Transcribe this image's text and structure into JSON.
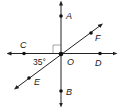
{
  "diagram": {
    "type": "intersecting-lines",
    "center": {
      "label": "O",
      "x": 61,
      "y": 54
    },
    "points": [
      {
        "label": "A",
        "x": 61,
        "y": 16,
        "lx": 66,
        "ly": 19
      },
      {
        "label": "B",
        "x": 61,
        "y": 91,
        "lx": 66,
        "ly": 95
      },
      {
        "label": "C",
        "x": 24,
        "y": 53,
        "lx": 20,
        "ly": 48
      },
      {
        "label": "D",
        "x": 100,
        "y": 53,
        "lx": 95,
        "ly": 66
      },
      {
        "label": "E",
        "x": 29,
        "y": 78,
        "lx": 34,
        "ly": 85
      },
      {
        "label": "F",
        "x": 91,
        "y": 33,
        "lx": 95,
        "ly": 41
      }
    ],
    "center_label_pos": {
      "x": 67,
      "y": 65
    },
    "angle_label": "35°",
    "angle_label_pos": {
      "x": 33,
      "y": 65
    },
    "right_angle_marker": true,
    "stroke_color": "#222222"
  }
}
